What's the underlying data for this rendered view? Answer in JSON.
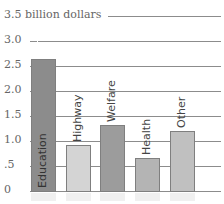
{
  "chart_data": {
    "type": "bar",
    "title": "",
    "ylabel": "3.5 billion dollars",
    "xlabel": "",
    "categories": [
      "Education",
      "Highway",
      "Welfare",
      "Health",
      "Other"
    ],
    "values": [
      2.64,
      0.92,
      1.32,
      0.66,
      1.2
    ],
    "ylim": [
      0,
      3.5
    ],
    "yticks": [
      "0",
      ".5",
      "1.0",
      "1.5",
      "2.0",
      "2.5",
      "3.0",
      "3.5"
    ],
    "grid": true,
    "legend": "none",
    "colors": [
      "#8c8c8c",
      "#d4d4d4",
      "#9c9c9c",
      "#b4b4b4",
      "#c0c0c0"
    ]
  },
  "axis": {
    "top_label": "3.5 billion dollars",
    "ticks": [
      {
        "label": "3.0",
        "value": 3.0
      },
      {
        "label": "2.5",
        "value": 2.5
      },
      {
        "label": "2.0",
        "value": 2.0
      },
      {
        "label": "1.5",
        "value": 1.5
      },
      {
        "label": "1.0",
        "value": 1.0
      },
      {
        "label": ".5",
        "value": 0.5
      },
      {
        "label": "0",
        "value": 0
      }
    ]
  }
}
